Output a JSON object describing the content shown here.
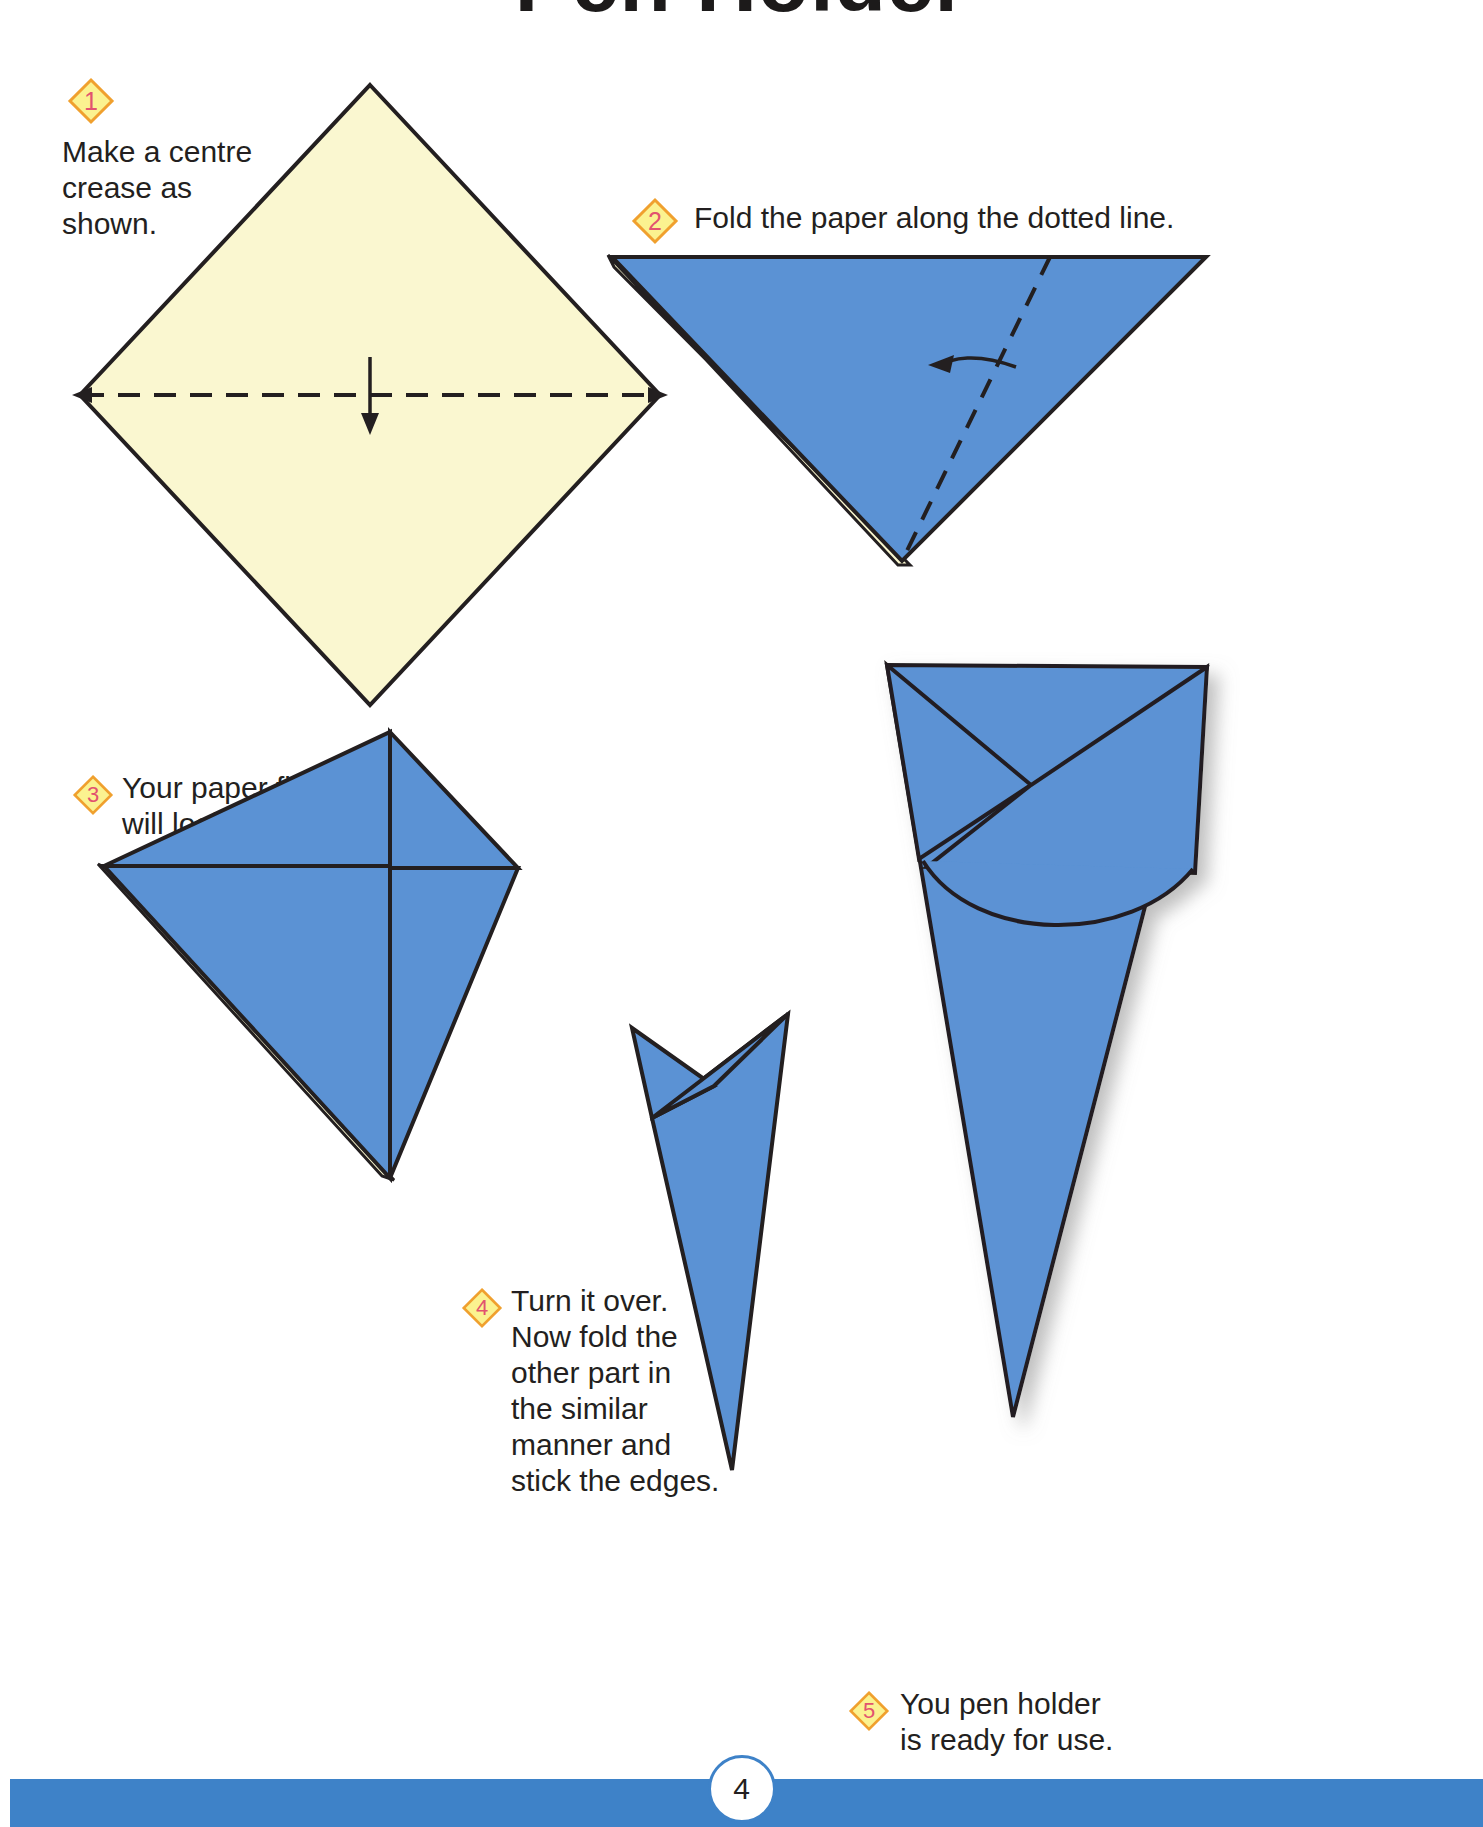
{
  "page": {
    "title": "Pen Holder",
    "page_number": "4",
    "background_color": "#ffffff",
    "footer_color": "#3e82c8"
  },
  "palette": {
    "paper_front": "#faf7d0",
    "paper_back": "#5b92d4",
    "paper_back_shade": "#4b83c8",
    "outline": "#231f20",
    "badge_fill": "#fbf290",
    "badge_border": "#f0a02e",
    "badge_number": "#e2526f",
    "text": "#231f20"
  },
  "steps": [
    {
      "number": "1",
      "text": "Make a centre\ncrease as\nshown.",
      "figure": "cream-square-diamond-with-centre-crease"
    },
    {
      "number": "2",
      "text": "Fold the paper along the dotted line.",
      "figure": "blue-triangle-with-dotted-fold-line-and-curved-arrow"
    },
    {
      "number": "3",
      "text": "Your paper figure\nwill look like this.",
      "figure": "blue-folded-arrow-shape"
    },
    {
      "number": "4",
      "text": "Turn it over.\nNow fold the\nother part in\nthe similar\nmanner and\nstick the edges.",
      "figure": "narrow-blue-cone-shape"
    },
    {
      "number": "5",
      "text": "You pen holder\nis ready for use.",
      "figure": "finished-blue-pen-holder-cone"
    }
  ]
}
